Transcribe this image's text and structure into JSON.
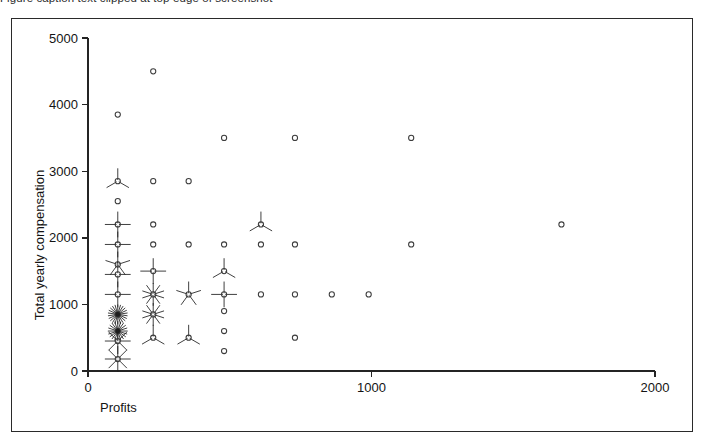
{
  "figure": {
    "top_caption": "Figure caption text clipped at top edge of screenshot",
    "frame_visible": true
  },
  "chart_data": {
    "type": "scatter",
    "title": "",
    "subtitle": "",
    "xlabel": "Profits",
    "ylabel": "Total yearly compensation",
    "xlim": [
      0,
      2000
    ],
    "ylim": [
      0,
      5000
    ],
    "xticks": [
      0,
      1000,
      2000
    ],
    "xticklabels": [
      "0",
      "1000",
      "2000"
    ],
    "yticks": [
      0,
      1000,
      2000,
      3000,
      4000,
      5000
    ],
    "yticklabels": [
      "0",
      "1000",
      "2000",
      "3000",
      "4000",
      "5000"
    ],
    "grid": false,
    "legend": null,
    "marker_style": "sunflower",
    "marker_note": "open circle = 1 observation; number of radiating petals = number of overlapping observations at that point",
    "points": [
      {
        "x": 105,
        "y": 3850,
        "count": 1
      },
      {
        "x": 230,
        "y": 4500,
        "count": 1
      },
      {
        "x": 105,
        "y": 2850,
        "count": 3
      },
      {
        "x": 105,
        "y": 2550,
        "count": 1
      },
      {
        "x": 105,
        "y": 2200,
        "count": 4
      },
      {
        "x": 105,
        "y": 1900,
        "count": 4
      },
      {
        "x": 105,
        "y": 1600,
        "count": 5
      },
      {
        "x": 105,
        "y": 1450,
        "count": 4
      },
      {
        "x": 105,
        "y": 1150,
        "count": 4
      },
      {
        "x": 105,
        "y": 850,
        "count": 22
      },
      {
        "x": 105,
        "y": 600,
        "count": 20
      },
      {
        "x": 105,
        "y": 450,
        "count": 8
      },
      {
        "x": 105,
        "y": 180,
        "count": 8
      },
      {
        "x": 230,
        "y": 2850,
        "count": 1
      },
      {
        "x": 230,
        "y": 2200,
        "count": 1
      },
      {
        "x": 230,
        "y": 1900,
        "count": 1
      },
      {
        "x": 230,
        "y": 1500,
        "count": 4
      },
      {
        "x": 230,
        "y": 1150,
        "count": 10
      },
      {
        "x": 230,
        "y": 850,
        "count": 10
      },
      {
        "x": 230,
        "y": 500,
        "count": 3
      },
      {
        "x": 355,
        "y": 2850,
        "count": 1
      },
      {
        "x": 355,
        "y": 1900,
        "count": 1
      },
      {
        "x": 355,
        "y": 1150,
        "count": 5
      },
      {
        "x": 355,
        "y": 500,
        "count": 3
      },
      {
        "x": 480,
        "y": 3500,
        "count": 1
      },
      {
        "x": 480,
        "y": 1900,
        "count": 1
      },
      {
        "x": 480,
        "y": 1500,
        "count": 3
      },
      {
        "x": 480,
        "y": 1150,
        "count": 4
      },
      {
        "x": 480,
        "y": 900,
        "count": 1
      },
      {
        "x": 480,
        "y": 600,
        "count": 1
      },
      {
        "x": 480,
        "y": 300,
        "count": 1
      },
      {
        "x": 610,
        "y": 2200,
        "count": 3
      },
      {
        "x": 610,
        "y": 1900,
        "count": 1
      },
      {
        "x": 610,
        "y": 1150,
        "count": 1
      },
      {
        "x": 730,
        "y": 3500,
        "count": 1
      },
      {
        "x": 730,
        "y": 1900,
        "count": 1
      },
      {
        "x": 730,
        "y": 1150,
        "count": 1
      },
      {
        "x": 730,
        "y": 500,
        "count": 1
      },
      {
        "x": 860,
        "y": 1150,
        "count": 1
      },
      {
        "x": 990,
        "y": 1150,
        "count": 1
      },
      {
        "x": 1140,
        "y": 3500,
        "count": 1
      },
      {
        "x": 1140,
        "y": 1900,
        "count": 1
      },
      {
        "x": 1670,
        "y": 2200,
        "count": 1
      }
    ]
  }
}
